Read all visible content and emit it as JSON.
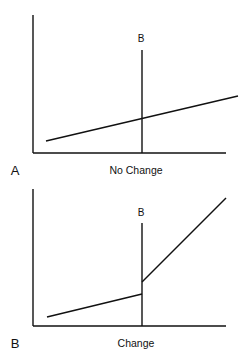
{
  "panels": [
    {
      "id": "A",
      "panel_label": "A",
      "caption": "No Change",
      "marker_label": "B",
      "description": "Single straight sloped line crossing marker B with no discontinuity",
      "series": [
        {
          "name": "trend",
          "points": [
            [
              46,
              141
            ],
            [
              238,
              96
            ]
          ]
        }
      ]
    },
    {
      "id": "B",
      "panel_label": "B",
      "caption": "Change",
      "marker_label": "B",
      "description": "Line shifts upward (level change) and becomes steeper (slope change) at marker B",
      "series": [
        {
          "name": "pre",
          "points": [
            [
              47,
              317
            ],
            [
              142,
              294
            ]
          ]
        },
        {
          "name": "post",
          "points": [
            [
              142,
              282
            ],
            [
              226,
              198
            ]
          ]
        }
      ]
    }
  ],
  "colors": {
    "line": "#111111",
    "background": "#ffffff"
  }
}
